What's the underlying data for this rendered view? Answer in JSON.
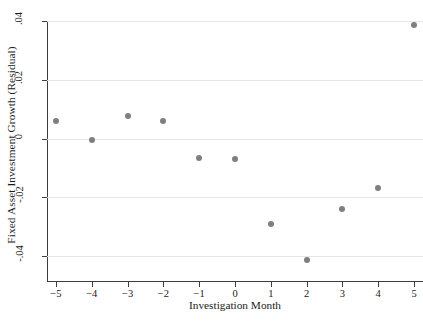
{
  "chart_data": {
    "type": "scatter",
    "title": "",
    "xlabel": "Investigation Month",
    "ylabel": "Fixed Asset Investment Growth (Residual)",
    "x": [
      -5,
      -4,
      -3,
      -2,
      -1,
      0,
      1,
      2,
      3,
      4,
      5
    ],
    "values": [
      0.006,
      -0.0005,
      0.0075,
      0.006,
      -0.0065,
      -0.007,
      -0.029,
      -0.0415,
      -0.024,
      -0.017,
      0.0385
    ],
    "xtick_labels": [
      "−5",
      "−4",
      "−3",
      "−2",
      "−1",
      "0",
      "1",
      "2",
      "3",
      "4",
      "5"
    ],
    "xticks": [
      -5,
      -4,
      -3,
      -2,
      -1,
      0,
      1,
      2,
      3,
      4,
      5
    ],
    "ytick_labels": [
      ".04",
      ".02",
      "0",
      "-.02",
      "-.04"
    ],
    "yticks": [
      0.04,
      0.02,
      0,
      -0.02,
      -0.04
    ],
    "xlim": [
      -5.25,
      5.25
    ],
    "ylim": [
      -0.0485,
      0.04
    ],
    "grid": "horizontal",
    "legend": "none",
    "marker_color": "#7f7f7f",
    "gridline_color": "#e6e6e6",
    "axis_color": "#3d3d3d"
  }
}
